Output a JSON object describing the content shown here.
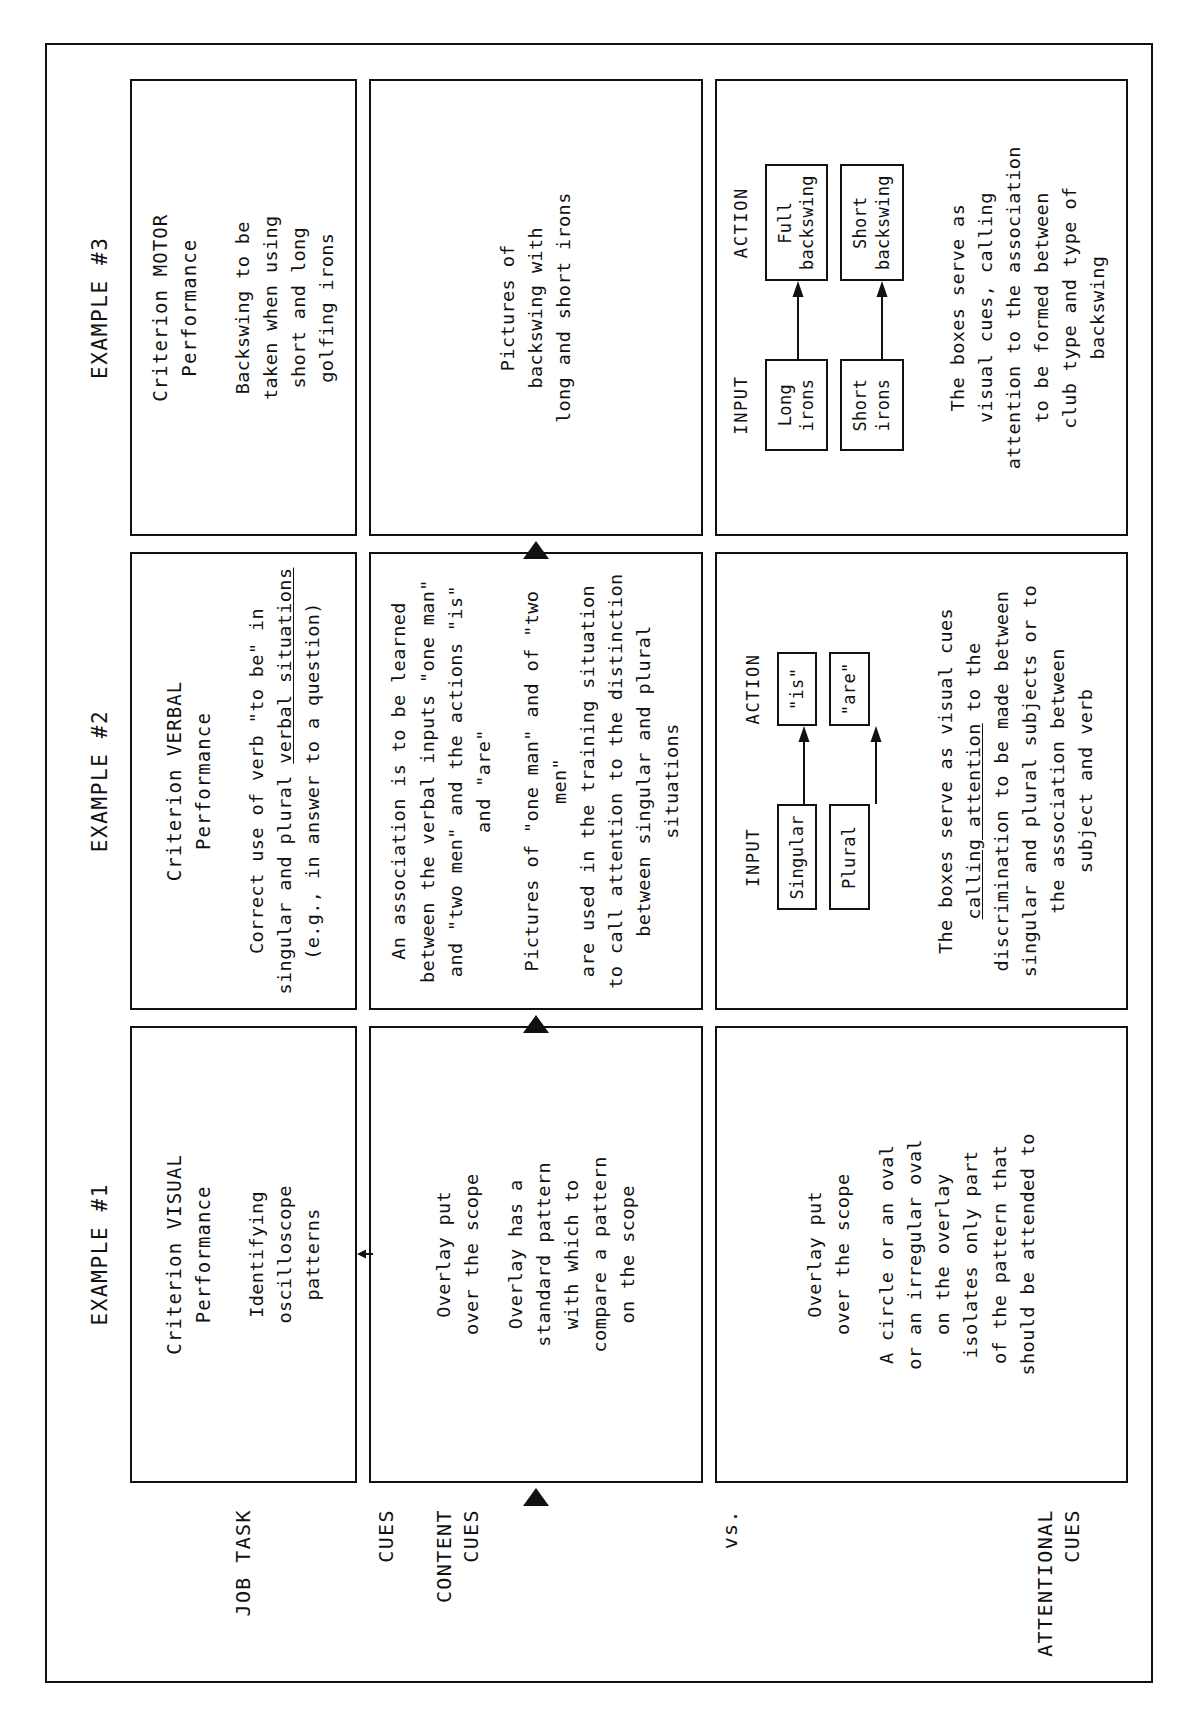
{
  "document": {
    "type": "instructional-matrix-diagram",
    "orientation": "rotated-90-ccw"
  },
  "columns": [
    {
      "header": "EXAMPLE #1"
    },
    {
      "header": "EXAMPLE #2"
    },
    {
      "header": "EXAMPLE #3"
    }
  ],
  "row_labels": {
    "job_task": "JOB TASK",
    "cues": "CUES",
    "content_cues": "CONTENT\nCUES",
    "vs": "vs.",
    "attentional_cues": "ATTENTIONAL\nCUES"
  },
  "rows": {
    "job_task": [
      {
        "title": "Criterion VISUAL\nPerformance",
        "body": "Identifying\noscilloscope\npatterns"
      },
      {
        "title": "Criterion VERBAL\nPerformance",
        "body_pre": "Correct use of verb \"to be\" in\nsingular and plural ",
        "body_underlined": "verbal situations",
        "body_post": "\n(e.g., in answer to a question)"
      },
      {
        "title": "Criterion MOTOR\nPerformance",
        "body": "Backswing to be\ntaken when using\nshort and long\ngolfing irons"
      }
    ],
    "content_cues": [
      {
        "paragraphs": [
          "Overlay put\nover the scope",
          "Overlay has a\nstandard pattern\nwith which to\ncompare a pattern\non the scope"
        ]
      },
      {
        "paragraphs": [
          "An association is to be learned\nbetween the verbal inputs \"one man\"\nand \"two men\" and the actions \"is\"\nand \"are\"",
          "Pictures of \"one man\" and of \"two men\"\nare used in the training situation\nto call attention to the distinction\nbetween singular and plural situations"
        ]
      },
      {
        "paragraphs": [
          "Pictures of\nbackswing with\nlong and short irons"
        ]
      }
    ],
    "attentional_cues": [
      {
        "paragraphs": [
          "Overlay put\nover the scope",
          "A circle or an oval\nor an irregular oval\non the overlay\nisolates only part\nof the pattern that\nshould be attended to"
        ]
      },
      {
        "diagram": {
          "input_header": "INPUT",
          "action_header": "ACTION",
          "pairs": [
            {
              "input": "Singular",
              "action": "\"is\""
            },
            {
              "input": "Plural",
              "action": "\"are\""
            }
          ]
        },
        "caption_pre": "The boxes serve as visual cues\n",
        "caption_underlined": "calling attention",
        "caption_post": " to the\ndiscrimination to be made between\nsingular and plural subjects or to\nthe association between\nsubject and verb"
      },
      {
        "diagram": {
          "input_header": "INPUT",
          "action_header": "ACTION",
          "pairs": [
            {
              "input": "Long\nirons",
              "action": "Full\nbackswing"
            },
            {
              "input": "Short\nirons",
              "action": "Short\nbackswing"
            }
          ]
        },
        "caption": "The boxes serve as\nvisual cues, calling\nattention to the association\nto be formed between\nclub type and type of\nbackswing"
      }
    ]
  },
  "colors": {
    "ink": "#111111",
    "paper": "#ffffff"
  }
}
